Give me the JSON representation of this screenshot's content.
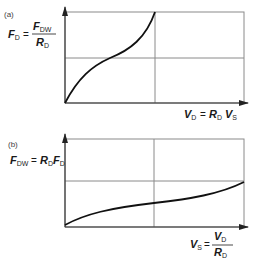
{
  "panels": [
    {
      "id": "a",
      "label": "(a)",
      "y_axis": {
        "lhs": "F",
        "lhs_sub": "D",
        "eq": "=",
        "num": "F",
        "num_sub": "DW",
        "den": "R",
        "den_sub": "D"
      },
      "x_axis": {
        "lhs": "V",
        "lhs_sub": "D",
        "eq": "=",
        "r": "R",
        "r_sub": "D",
        "v": "V",
        "v_sub": "S"
      },
      "curve_shape": "concave-then-convex rising (cubic-like) from origin to top at center"
    },
    {
      "id": "b",
      "label": "(b)",
      "y_axis": {
        "lhs": "F",
        "lhs_sub": "DW",
        "eq": "=",
        "r": "R",
        "r_sub": "D",
        "f": "F",
        "f_sub": "D"
      },
      "x_axis": {
        "lhs": "V",
        "lhs_sub": "S",
        "eq": "=",
        "num": "V",
        "num_sub": "D",
        "den": "R",
        "den_sub": "D"
      },
      "curve_shape": "gently rising S-curve from origin to midline at right edge"
    }
  ],
  "colors": {
    "frame": "#8a8a8a",
    "curve": "#111111",
    "axis": "#333333"
  }
}
